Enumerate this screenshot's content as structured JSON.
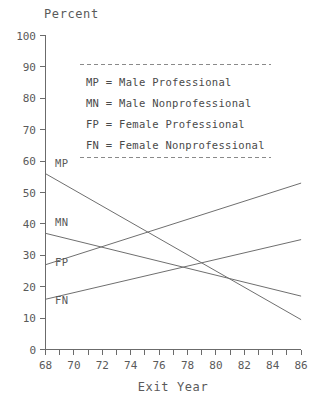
{
  "chart_data": {
    "type": "line",
    "title": "",
    "ylabel": "Percent",
    "xlabel": "Exit Year",
    "xlim": [
      68,
      86
    ],
    "ylim": [
      0,
      100
    ],
    "grid": false,
    "legend_position": "top-center-inset",
    "y_ticks": [
      0,
      10,
      20,
      30,
      40,
      50,
      60,
      70,
      80,
      90,
      100
    ],
    "x_ticks": [
      68,
      69,
      70,
      71,
      72,
      73,
      74,
      75,
      76,
      77,
      78,
      79,
      80,
      81,
      82,
      83,
      84,
      85,
      86
    ],
    "x_tick_labels": [
      "68",
      "",
      "70",
      "",
      "72",
      "",
      "74",
      "",
      "76",
      "",
      "78",
      "",
      "80",
      "",
      "82",
      "",
      "84",
      "",
      "86"
    ],
    "x": [
      68,
      86
    ],
    "series": [
      {
        "name": "MP",
        "label": "MP",
        "description": "Male Professional",
        "values": [
          56,
          9.5
        ]
      },
      {
        "name": "MN",
        "label": "MN",
        "description": "Male Nonprofessional",
        "values": [
          37,
          17
        ]
      },
      {
        "name": "FP",
        "label": "FP",
        "description": "Female Professional",
        "values": [
          27,
          53
        ]
      },
      {
        "name": "FN",
        "label": "FN",
        "description": "Female Nonprofessional",
        "values": [
          16,
          35
        ]
      }
    ],
    "line_color": "#6f6f6f",
    "axis_color": "#6b6b6b",
    "text_color": "#5a5a5a"
  },
  "legend": {
    "entries": [
      {
        "code": "MP",
        "equals": "=",
        "meaning": "Male Professional",
        "full": "MP = Male Professional"
      },
      {
        "code": "MN",
        "equals": "=",
        "meaning": "Male Nonprofessional",
        "full": "MN = Male Nonprofessional"
      },
      {
        "code": "FP",
        "equals": "=",
        "meaning": "Female Professional",
        "full": "FP = Female Professional"
      },
      {
        "code": "FN",
        "equals": "=",
        "meaning": "Female Nonprofessional",
        "full": "FN = Female Nonprofessional"
      }
    ]
  },
  "axis": {
    "y_title": "Percent",
    "x_title": "Exit Year",
    "y_labels": [
      "100",
      "90",
      "80",
      "70",
      "60",
      "50",
      "40",
      "30",
      "20",
      "10",
      "0"
    ],
    "x_labels": [
      "68",
      "70",
      "72",
      "74",
      "76",
      "78",
      "80",
      "82",
      "84",
      "86"
    ]
  },
  "curve_labels": {
    "mp": "MP",
    "mn": "MN",
    "fp": "FP",
    "fn": "FN"
  }
}
